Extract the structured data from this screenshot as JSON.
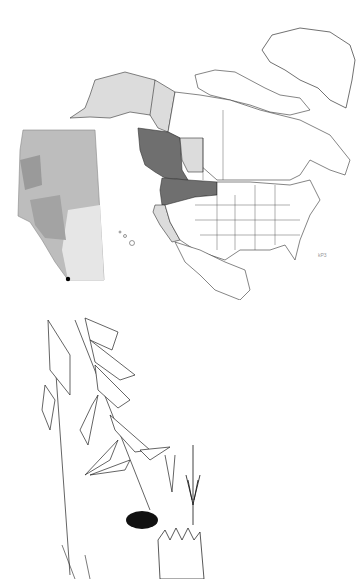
{
  "map": {
    "title": "North America distribution map with Alberta inset",
    "legend_code": "kP3",
    "colors": {
      "range_dark": "#6f6f6f",
      "range_light": "#dcdcdc",
      "outline": "#333333",
      "alberta_fill": "#b9b9b9",
      "background": "#ffffff"
    },
    "shaded_regions_dark": [
      "British Columbia",
      "Washington",
      "Oregon",
      "Idaho",
      "Montana"
    ],
    "shaded_regions_light": [
      "Alaska",
      "Yukon",
      "Alberta",
      "California"
    ],
    "inset": {
      "region": "Alberta",
      "occurrence_marker": "southwest corner"
    }
  },
  "illustration": {
    "subject": "Botanical line drawing of plant with leaves, flower head, florets and involucral bracts"
  }
}
